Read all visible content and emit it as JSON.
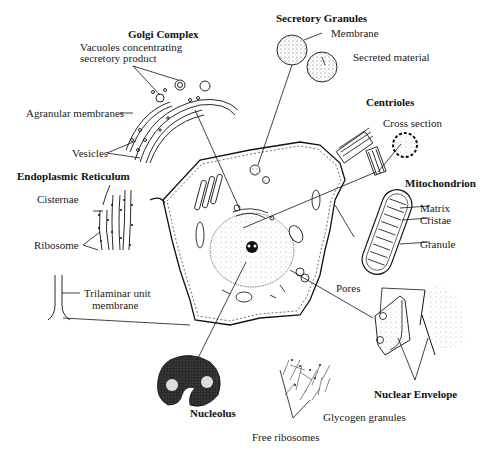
{
  "diagram": {
    "sections": {
      "golgi": {
        "title": "Golgi Complex",
        "labels": [
          "Vacuoles concentrating",
          "secretory product",
          "Agranular membranes",
          "Vesicles"
        ]
      },
      "secretory": {
        "title": "Secretory Granules",
        "labels": [
          "Membrane",
          "Secreted material"
        ]
      },
      "centrioles": {
        "title": "Centrioles",
        "labels": [
          "Cross section"
        ]
      },
      "er": {
        "title": "Endoplasmic Reticulum",
        "labels": [
          "Cisternae",
          "Ribosome"
        ]
      },
      "mito": {
        "title": "Mitochondrion",
        "labels": [
          "Matrix",
          "Cristae",
          "Granule"
        ]
      },
      "membrane": {
        "labels": [
          "Trilaminar unit",
          "membrane"
        ]
      },
      "nuclear": {
        "title": "Nuclear Envelope",
        "labels": [
          "Pores"
        ]
      },
      "nucleolus": {
        "title": "Nucleolus"
      },
      "cytoplasm": {
        "labels": [
          "Glycogen granules",
          "Free ribosomes"
        ]
      }
    },
    "colors": {
      "ink": "#111111",
      "background": "#ffffff",
      "stipple": "#777777"
    }
  }
}
